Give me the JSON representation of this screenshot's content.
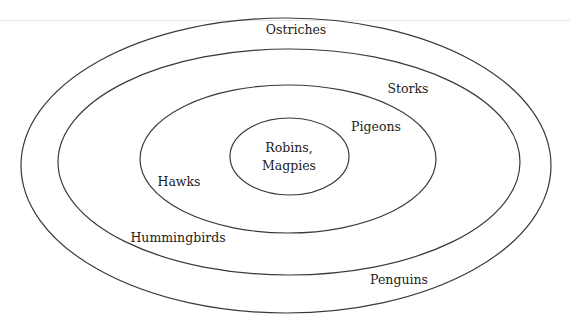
{
  "diagram": {
    "type": "nested-set-diagram",
    "stroke_color": "#3a3a3a",
    "levels": [
      {
        "label": "Ostriches"
      },
      {
        "label": "Storks"
      },
      {
        "label": "Penguins"
      },
      {
        "label": "Hummingbirds"
      },
      {
        "label": "Pigeons"
      },
      {
        "label": "Hawks"
      },
      {
        "label": "Robins,"
      },
      {
        "label": "Magpies"
      }
    ],
    "labels": {
      "ostriches": "Ostriches",
      "storks": "Storks",
      "penguins": "Penguins",
      "hummingbirds": "Hummingbirds",
      "pigeons": "Pigeons",
      "hawks": "Hawks",
      "center_line1": "Robins,",
      "center_line2": "Magpies"
    },
    "ellipses": [
      {
        "name": "outer",
        "contains": [
          "Ostriches"
        ]
      },
      {
        "name": "second",
        "contains": [
          "Storks",
          "Penguins",
          "Hummingbirds"
        ]
      },
      {
        "name": "third",
        "contains": [
          "Pigeons",
          "Hawks"
        ]
      },
      {
        "name": "inner",
        "contains": [
          "Robins",
          "Magpies"
        ]
      }
    ]
  }
}
